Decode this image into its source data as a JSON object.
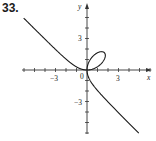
{
  "problem": {
    "number": "33."
  },
  "chart_data": {
    "type": "line",
    "title": "",
    "xlabel": "x",
    "ylabel": "y",
    "xlim": [
      -6,
      6
    ],
    "ylim": [
      -6,
      6
    ],
    "grid": false,
    "x_ticks": [
      -6,
      -5,
      -4,
      -3,
      -2,
      -1,
      1,
      2,
      3,
      4,
      5,
      6
    ],
    "y_ticks": [
      -6,
      -5,
      -4,
      -3,
      -2,
      -1,
      1,
      2,
      3,
      4,
      5
    ],
    "x_tick_labels": [
      {
        "value": -3,
        "label": "−3"
      },
      {
        "value": 0,
        "label": "0"
      },
      {
        "value": 3,
        "label": "3"
      }
    ],
    "y_tick_labels": [
      {
        "value": 3,
        "label": "3"
      },
      {
        "value": -3,
        "label": "−3"
      }
    ],
    "curve": {
      "description": "Folium-like curve x^3 + y^3 = 3axy, a≈1.1; loop in first quadrant, branches to upper-left and lower-right",
      "loop_max_point": [
        1.6,
        1.7
      ],
      "branch_upper_left_end": [
        -6,
        5.2
      ],
      "branch_lower_right_end": [
        5.2,
        -6
      ],
      "color": "#1a1a1a"
    }
  },
  "labels": {
    "x_axis": "x",
    "y_axis": "y",
    "origin": "0",
    "x_neg3": "−3",
    "x_pos3": "3",
    "y_pos3": "3",
    "y_neg3": "−3"
  }
}
